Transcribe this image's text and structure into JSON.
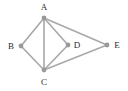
{
  "figure": {
    "kind": "graph-diagram",
    "width": 128,
    "height": 91,
    "background_color": "#ffffff",
    "edge_color": "#a8a8a8",
    "node_color": "#999999",
    "label_color": "#2b2b2b",
    "node_radius": 2.4,
    "edge_width": 1.6
  },
  "chart_data": {
    "type": "diagram",
    "title": "",
    "nodes": [
      {
        "id": "A",
        "label": "A",
        "x": 44,
        "y": 18,
        "label_x": 44,
        "label_y": 7
      },
      {
        "id": "B",
        "label": "B",
        "x": 21,
        "y": 46,
        "label_x": 11,
        "label_y": 46
      },
      {
        "id": "C",
        "label": "C",
        "x": 44,
        "y": 70,
        "label_x": 44,
        "label_y": 82
      },
      {
        "id": "D",
        "label": "D",
        "x": 68,
        "y": 45,
        "label_x": 77,
        "label_y": 45
      },
      {
        "id": "E",
        "label": "E",
        "x": 107,
        "y": 45,
        "label_x": 117,
        "label_y": 45
      }
    ],
    "edges": [
      {
        "from": "A",
        "to": "B"
      },
      {
        "from": "A",
        "to": "C"
      },
      {
        "from": "A",
        "to": "D"
      },
      {
        "from": "A",
        "to": "E"
      },
      {
        "from": "B",
        "to": "C"
      },
      {
        "from": "C",
        "to": "D"
      },
      {
        "from": "C",
        "to": "E"
      }
    ],
    "node_count": 5,
    "edge_count": 7,
    "directed": false,
    "legend": [],
    "annotations": []
  }
}
